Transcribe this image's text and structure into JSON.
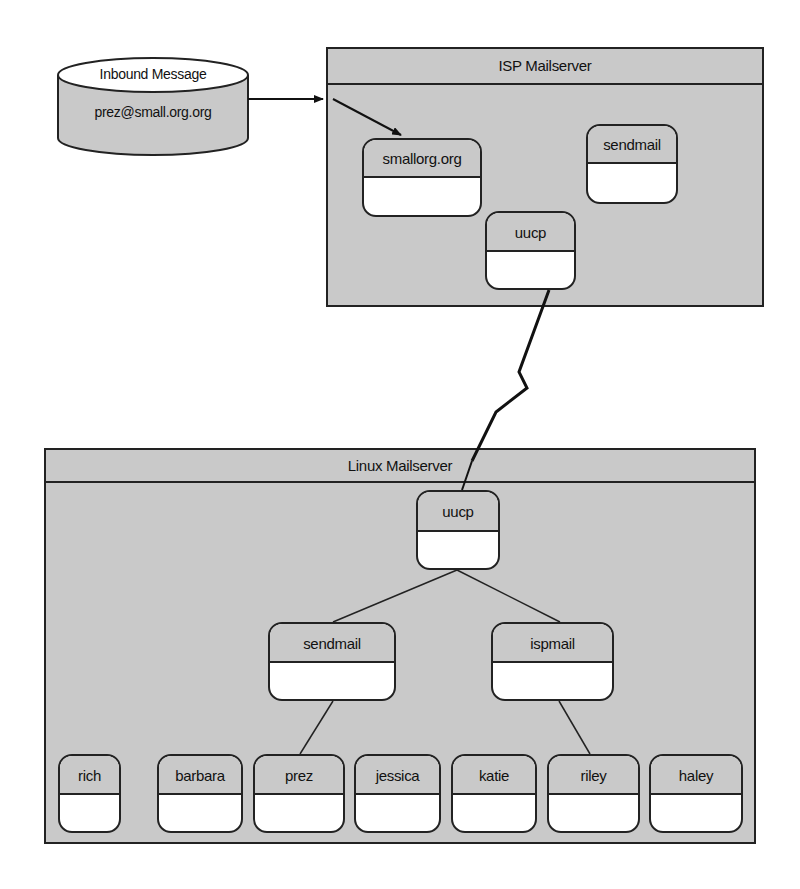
{
  "inbound": {
    "title": "Inbound Message",
    "address": "prez@small.org.org"
  },
  "isp_server": {
    "title": "ISP Mailserver",
    "nodes": [
      {
        "label": "smallorg.org"
      },
      {
        "label": "sendmail"
      },
      {
        "label": "uucp"
      }
    ]
  },
  "linux_server": {
    "title": "Linux Mailserver",
    "nodes": [
      {
        "label": "uucp"
      },
      {
        "label": "sendmail"
      },
      {
        "label": "ispmail"
      }
    ],
    "users": [
      {
        "label": "rich"
      },
      {
        "label": "barbara"
      },
      {
        "label": "prez"
      },
      {
        "label": "jessica"
      },
      {
        "label": "katie"
      },
      {
        "label": "riley"
      },
      {
        "label": "haley"
      }
    ]
  },
  "colors": {
    "fill_gray": "#c9c9c9",
    "stroke": "#222222",
    "background": "#ffffff"
  }
}
